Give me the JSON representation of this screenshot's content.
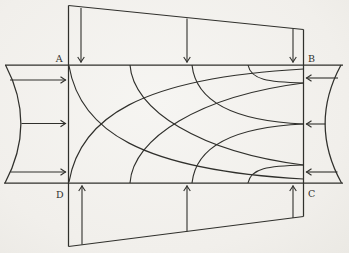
{
  "figure": {
    "paper_color": "#f2f0ec",
    "ink_color": "#30302c",
    "canvas": {
      "width": 349,
      "height": 253
    },
    "corner_labels": [
      {
        "text": "A",
        "x": 63,
        "y": 62,
        "anchor": "end"
      },
      {
        "text": "B",
        "x": 308,
        "y": 62,
        "anchor": "start"
      },
      {
        "text": "D",
        "x": 64,
        "y": 198,
        "anchor": "end"
      },
      {
        "text": "C",
        "x": 308,
        "y": 197,
        "anchor": "start"
      }
    ],
    "lines": [
      {
        "name": "plate-top-edge",
        "x1": 5,
        "y1": 65,
        "x2": 343,
        "y2": 65
      },
      {
        "name": "plate-bottom-edge",
        "x1": 4,
        "y1": 183,
        "x2": 343,
        "y2": 183
      },
      {
        "name": "left-vertical-edge",
        "x1": 68.5,
        "y1": 5.5,
        "x2": 68.5,
        "y2": 246.5
      },
      {
        "name": "right-vertical-edge",
        "x1": 303.5,
        "y1": 29.5,
        "x2": 303.5,
        "y2": 216.5
      },
      {
        "name": "top-load-slant-edge",
        "x1": 68.5,
        "y1": 5.5,
        "x2": 303.5,
        "y2": 29.5
      },
      {
        "name": "bottom-load-slant-edge",
        "x1": 68.5,
        "y1": 246.5,
        "x2": 303.5,
        "y2": 216.5
      }
    ],
    "boundary_curves": [
      {
        "name": "left-load-concave-boundary",
        "d": "M 5.5,65 Q 36.5,124 5,183"
      },
      {
        "name": "right-load-concave-boundary",
        "d": "M 341,65 Q 309,124 341.5,183"
      }
    ],
    "trajectories": [
      {
        "name": "trajectory-rising-1",
        "d": "M 69,182 C 80,118 140,78 303.5,69"
      },
      {
        "name": "trajectory-rising-2",
        "d": "M 130,183 C 133,138 200,96 303.5,83"
      },
      {
        "name": "trajectory-rising-3",
        "d": "M 192,183 C 196,146 235,127 303.5,124"
      },
      {
        "name": "trajectory-rising-4",
        "d": "M 248,183 C 251,168 268,166 303.5,165"
      },
      {
        "name": "trajectory-falling-1",
        "d": "M 69,66 C 80,130 140,170 303.5,179"
      },
      {
        "name": "trajectory-falling-2",
        "d": "M 130,65 C 133,110 200,152 303.5,165"
      },
      {
        "name": "trajectory-falling-3",
        "d": "M 192,65 C 196,102 235,121 303.5,124"
      },
      {
        "name": "trajectory-falling-4",
        "d": "M 248,65 C 251,80 268,82 303.5,83"
      }
    ],
    "arrows": [
      {
        "name": "top-load-arrow-left",
        "x1": 81,
        "y1": 8,
        "x2": 81,
        "y2": 62.5
      },
      {
        "name": "top-load-arrow-middle",
        "x1": 187,
        "y1": 18.5,
        "x2": 187,
        "y2": 62.5
      },
      {
        "name": "top-load-arrow-right",
        "x1": 293,
        "y1": 28.5,
        "x2": 293,
        "y2": 62.5
      },
      {
        "name": "bottom-load-arrow-left",
        "x1": 82,
        "y1": 244.5,
        "x2": 82,
        "y2": 185.5
      },
      {
        "name": "bottom-load-arrow-middle",
        "x1": 187,
        "y1": 231.5,
        "x2": 187,
        "y2": 185.5
      },
      {
        "name": "bottom-load-arrow-right",
        "x1": 293,
        "y1": 218,
        "x2": 293,
        "y2": 185.5
      },
      {
        "name": "left-load-arrow-top",
        "x1": 10,
        "y1": 80,
        "x2": 66,
        "y2": 80
      },
      {
        "name": "left-load-arrow-middle",
        "x1": 21.5,
        "y1": 123.5,
        "x2": 66,
        "y2": 123.5
      },
      {
        "name": "left-load-arrow-bottom",
        "x1": 10.5,
        "y1": 172,
        "x2": 66,
        "y2": 172
      },
      {
        "name": "right-load-arrow-top",
        "x1": 338,
        "y1": 78,
        "x2": 306,
        "y2": 78
      },
      {
        "name": "right-load-arrow-middle",
        "x1": 325.5,
        "y1": 124,
        "x2": 306,
        "y2": 124
      },
      {
        "name": "right-load-arrow-bottom",
        "x1": 337.5,
        "y1": 172,
        "x2": 306,
        "y2": 172
      }
    ]
  }
}
